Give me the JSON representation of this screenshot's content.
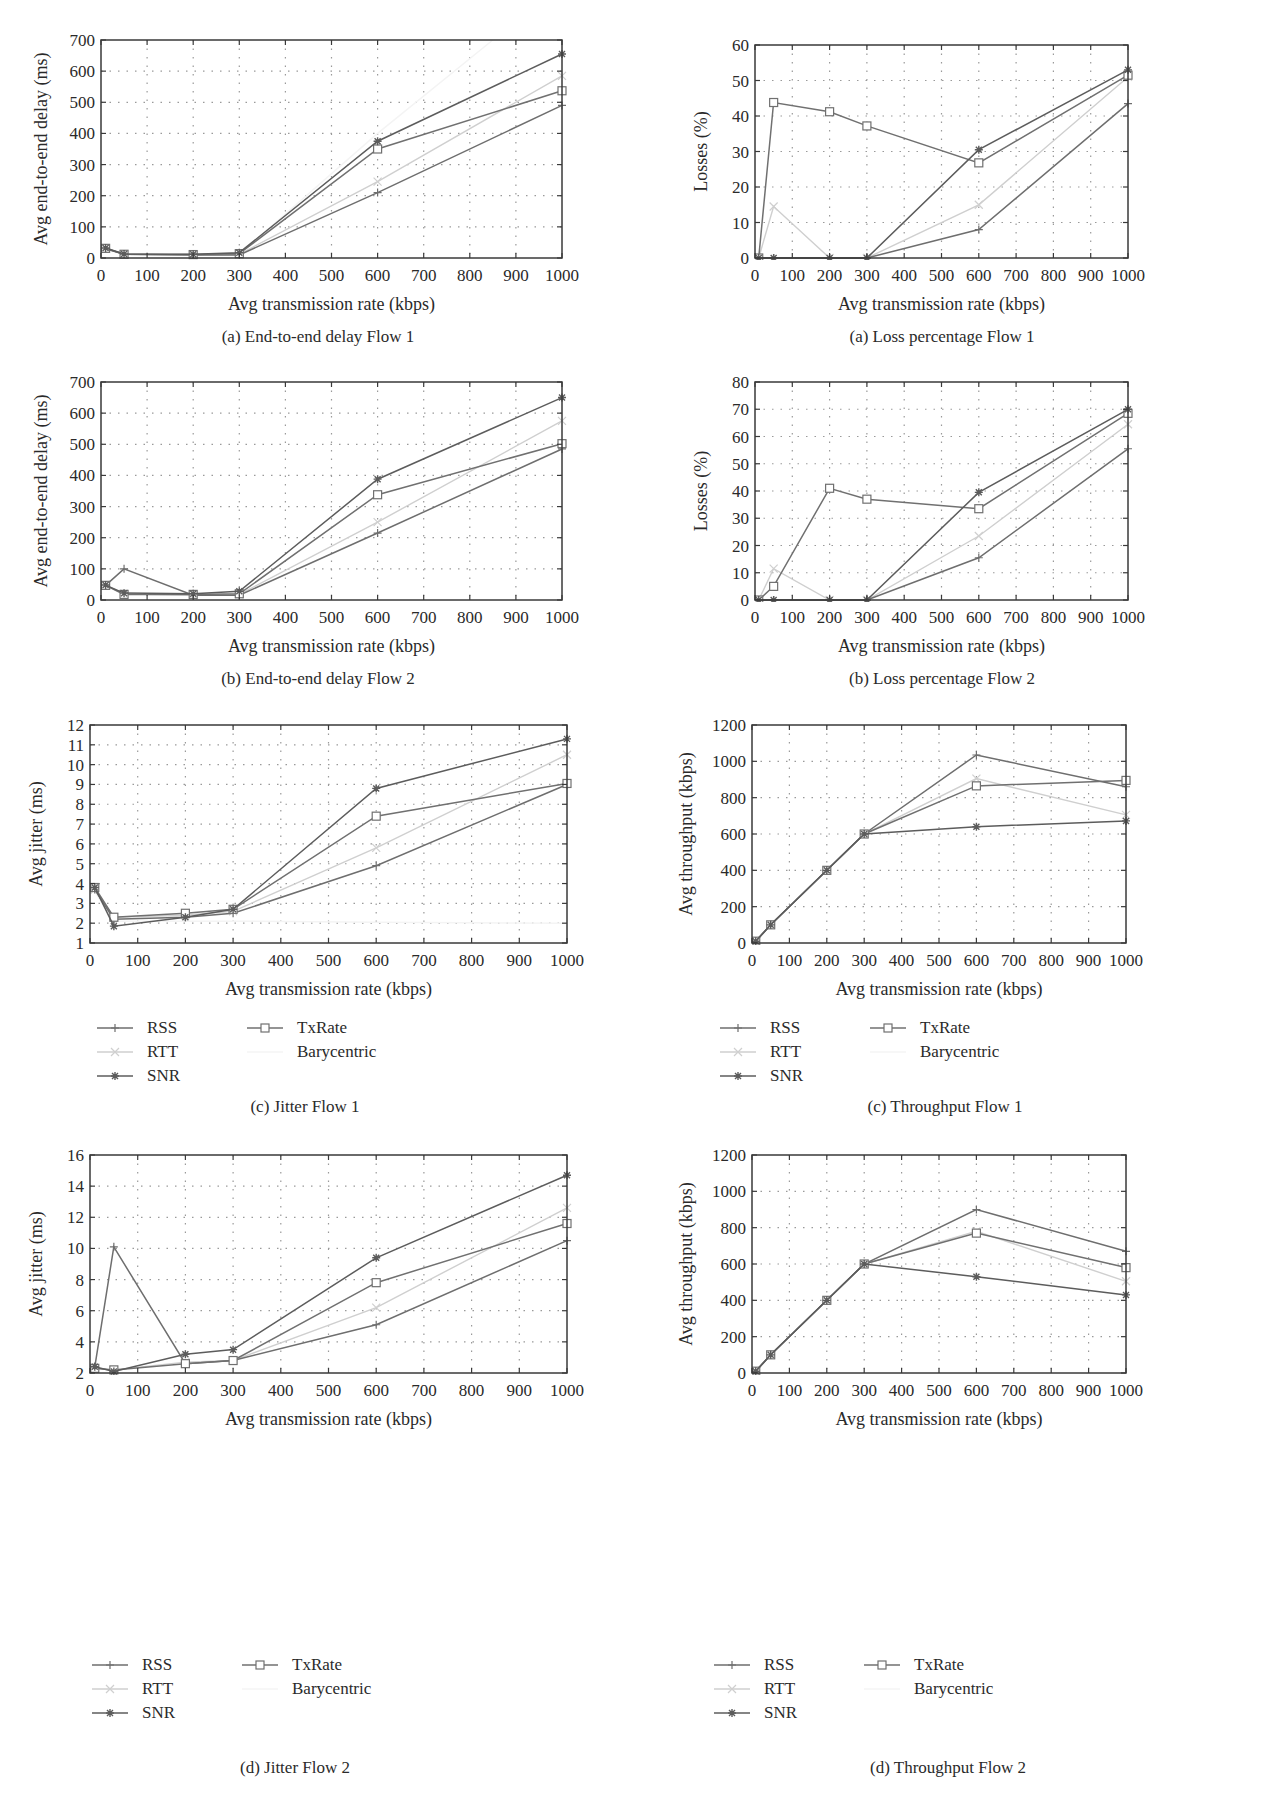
{
  "figure": {
    "series_styles": {
      "RSS": {
        "color": "#6e6e6e",
        "marker": "plus"
      },
      "RTT": {
        "color": "#cfcfcf",
        "marker": "x"
      },
      "SNR": {
        "color": "#5c5c5c",
        "marker": "star"
      },
      "TxRate": {
        "color": "#707070",
        "marker": "square"
      },
      "Barycentric": {
        "color": "#f4f4f4",
        "marker": "none"
      }
    },
    "legend_entries": [
      "RSS",
      "RTT",
      "SNR",
      "TxRate",
      "Barycentric"
    ]
  },
  "chart_data": [
    {
      "id": "delay_flow1",
      "type": "line",
      "caption": "(a)  End-to-end delay Flow 1",
      "xlabel": "Avg transmission rate (kbps)",
      "ylabel": "Avg end-to-end delay (ms)",
      "xlim": [
        0,
        1000
      ],
      "ylim": [
        0,
        700
      ],
      "xticks": [
        0,
        100,
        200,
        300,
        400,
        500,
        600,
        700,
        800,
        900,
        1000
      ],
      "yticks": [
        0,
        100,
        200,
        300,
        400,
        500,
        600,
        700
      ],
      "grid": true,
      "legend": false,
      "x": [
        10,
        50,
        200,
        300,
        600,
        1000
      ],
      "series": [
        {
          "name": "RSS",
          "values": [
            30,
            12,
            10,
            10,
            210,
            490
          ]
        },
        {
          "name": "RTT",
          "values": [
            30,
            12,
            10,
            12,
            245,
            585
          ]
        },
        {
          "name": "SNR",
          "values": [
            32,
            13,
            12,
            17,
            375,
            655
          ]
        },
        {
          "name": "TxRate",
          "values": [
            31,
            12,
            11,
            14,
            350,
            537
          ]
        },
        {
          "name": "Barycentric",
          "x": [
            10,
            50,
            200,
            300,
            600,
            850
          ],
          "values": [
            30,
            12,
            10,
            12,
            400,
            700
          ]
        }
      ]
    },
    {
      "id": "loss_flow1",
      "type": "line",
      "caption": "(a)  Loss percentage Flow 1",
      "xlabel": "Avg transmission rate (kbps)",
      "ylabel": "Losses (%)",
      "xlim": [
        0,
        1000
      ],
      "ylim": [
        0,
        60
      ],
      "xticks": [
        0,
        100,
        200,
        300,
        400,
        500,
        600,
        700,
        800,
        900,
        1000
      ],
      "yticks": [
        0,
        10,
        20,
        30,
        40,
        50,
        60
      ],
      "grid": true,
      "legend": false,
      "x": [
        10,
        50,
        200,
        300,
        600,
        1000
      ],
      "series": [
        {
          "name": "RSS",
          "values": [
            0,
            0,
            0,
            0,
            8,
            43.5
          ]
        },
        {
          "name": "RTT",
          "values": [
            0,
            14.5,
            0,
            0,
            15,
            51
          ]
        },
        {
          "name": "SNR",
          "values": [
            0,
            0,
            0,
            0,
            30.5,
            53
          ]
        },
        {
          "name": "TxRate",
          "values": [
            0,
            43.8,
            41.2,
            37.2,
            26.8,
            51.5
          ]
        }
      ]
    },
    {
      "id": "delay_flow2",
      "type": "line",
      "caption": "(b)  End-to-end delay Flow 2",
      "xlabel": "Avg transmission rate (kbps)",
      "ylabel": "Avg end-to-end delay (ms)",
      "xlim": [
        0,
        1000
      ],
      "ylim": [
        0,
        700
      ],
      "xticks": [
        0,
        100,
        200,
        300,
        400,
        500,
        600,
        700,
        800,
        900,
        1000
      ],
      "yticks": [
        0,
        100,
        200,
        300,
        400,
        500,
        600,
        700
      ],
      "grid": true,
      "legend": false,
      "x": [
        10,
        50,
        200,
        300,
        600,
        1000
      ],
      "series": [
        {
          "name": "RSS",
          "values": [
            47,
            100,
            15,
            15,
            215,
            485
          ]
        },
        {
          "name": "RTT",
          "values": [
            47,
            20,
            15,
            18,
            250,
            575
          ]
        },
        {
          "name": "SNR",
          "values": [
            48,
            22,
            20,
            28,
            388,
            650
          ]
        },
        {
          "name": "TxRate",
          "values": [
            47,
            18,
            18,
            20,
            338,
            502
          ]
        }
      ]
    },
    {
      "id": "loss_flow2",
      "type": "line",
      "caption": "(b)  Loss percentage Flow 2",
      "xlabel": "Avg transmission rate (kbps)",
      "ylabel": "Losses (%)",
      "xlim": [
        0,
        1000
      ],
      "ylim": [
        0,
        80
      ],
      "xticks": [
        0,
        100,
        200,
        300,
        400,
        500,
        600,
        700,
        800,
        900,
        1000
      ],
      "yticks": [
        0,
        10,
        20,
        30,
        40,
        50,
        60,
        70,
        80
      ],
      "grid": true,
      "legend": false,
      "x": [
        10,
        50,
        200,
        300,
        600,
        1000
      ],
      "series": [
        {
          "name": "RSS",
          "values": [
            0,
            0,
            0,
            0,
            15.5,
            55.5
          ]
        },
        {
          "name": "RTT",
          "values": [
            0,
            11.5,
            0,
            0,
            23.5,
            64.5
          ]
        },
        {
          "name": "SNR",
          "values": [
            0,
            0,
            0,
            0,
            39.5,
            70
          ]
        },
        {
          "name": "TxRate",
          "values": [
            0,
            5,
            41,
            37,
            33.5,
            68.5
          ]
        }
      ]
    },
    {
      "id": "jitter_flow1",
      "type": "line",
      "caption": "(c)  Jitter Flow 1",
      "xlabel": "Avg transmission rate (kbps)",
      "ylabel": "Avg jitter (ms)",
      "xlim": [
        0,
        1000
      ],
      "ylim": [
        1,
        12
      ],
      "xticks": [
        0,
        100,
        200,
        300,
        400,
        500,
        600,
        700,
        800,
        900,
        1000
      ],
      "yticks": [
        1,
        2,
        3,
        4,
        5,
        6,
        7,
        8,
        9,
        10,
        11,
        12
      ],
      "grid": true,
      "legend": true,
      "x": [
        10,
        50,
        200,
        300,
        600,
        1000
      ],
      "series": [
        {
          "name": "RSS",
          "values": [
            3.7,
            2.2,
            2.3,
            2.5,
            4.9,
            9.0
          ]
        },
        {
          "name": "RTT",
          "values": [
            3.7,
            2.3,
            2.4,
            2.6,
            5.8,
            10.5
          ]
        },
        {
          "name": "SNR",
          "values": [
            3.8,
            1.85,
            2.3,
            2.7,
            8.8,
            11.3
          ]
        },
        {
          "name": "TxRate",
          "values": [
            3.8,
            2.3,
            2.5,
            2.7,
            7.4,
            9.05
          ]
        },
        {
          "name": "Barycentric",
          "values": [
            3.6,
            2.1,
            2.1,
            2.1,
            2.05,
            2.0
          ]
        }
      ]
    },
    {
      "id": "throughput_flow1",
      "type": "line",
      "caption": "(c)  Throughput Flow 1",
      "xlabel": "Avg transmission rate (kbps)",
      "ylabel": "Avg throughput (kbps)",
      "xlim": [
        0,
        1000
      ],
      "ylim": [
        0,
        1200
      ],
      "xticks": [
        0,
        100,
        200,
        300,
        400,
        500,
        600,
        700,
        800,
        900,
        1000
      ],
      "yticks": [
        0,
        200,
        400,
        600,
        800,
        1000,
        1200
      ],
      "grid": true,
      "legend": true,
      "x": [
        10,
        50,
        200,
        300,
        600,
        1000
      ],
      "series": [
        {
          "name": "RSS",
          "values": [
            10,
            100,
            400,
            600,
            1035,
            860
          ]
        },
        {
          "name": "RTT",
          "values": [
            10,
            100,
            400,
            600,
            905,
            705
          ]
        },
        {
          "name": "SNR",
          "values": [
            10,
            100,
            400,
            600,
            640,
            672
          ]
        },
        {
          "name": "TxRate",
          "values": [
            10,
            100,
            400,
            600,
            865,
            895
          ]
        }
      ]
    },
    {
      "id": "jitter_flow2",
      "type": "line",
      "caption": "(d)  Jitter Flow 2",
      "xlabel": "Avg transmission rate (kbps)",
      "ylabel": "Avg jitter (ms)",
      "xlim": [
        0,
        1000
      ],
      "ylim": [
        2,
        16
      ],
      "xticks": [
        0,
        100,
        200,
        300,
        400,
        500,
        600,
        700,
        800,
        900,
        1000
      ],
      "yticks": [
        2,
        4,
        6,
        8,
        10,
        12,
        14,
        16
      ],
      "grid": true,
      "legend": true,
      "x": [
        10,
        50,
        200,
        300,
        600,
        1000
      ],
      "series": [
        {
          "name": "RSS",
          "values": [
            2.4,
            10.1,
            2.6,
            2.8,
            5.1,
            10.5
          ]
        },
        {
          "name": "RTT",
          "values": [
            2.3,
            2.2,
            2.7,
            2.8,
            6.2,
            12.6
          ]
        },
        {
          "name": "SNR",
          "values": [
            2.4,
            2.1,
            3.2,
            3.5,
            9.4,
            14.7
          ]
        },
        {
          "name": "TxRate",
          "values": [
            2.3,
            2.2,
            2.6,
            2.8,
            7.8,
            11.6
          ]
        }
      ]
    },
    {
      "id": "throughput_flow2",
      "type": "line",
      "caption": "(d)  Throughput Flow 2",
      "xlabel": "Avg transmission rate (kbps)",
      "ylabel": "Avg throughput (kbps)",
      "xlim": [
        0,
        1000
      ],
      "ylim": [
        0,
        1200
      ],
      "xticks": [
        0,
        100,
        200,
        300,
        400,
        500,
        600,
        700,
        800,
        900,
        1000
      ],
      "yticks": [
        0,
        200,
        400,
        600,
        800,
        1000,
        1200
      ],
      "grid": true,
      "legend": true,
      "x": [
        10,
        50,
        200,
        300,
        600,
        1000
      ],
      "series": [
        {
          "name": "RSS",
          "values": [
            10,
            100,
            400,
            600,
            900,
            670
          ]
        },
        {
          "name": "RTT",
          "values": [
            10,
            100,
            400,
            600,
            780,
            505
          ]
        },
        {
          "name": "SNR",
          "values": [
            10,
            100,
            400,
            600,
            530,
            430
          ]
        },
        {
          "name": "TxRate",
          "values": [
            10,
            100,
            400,
            600,
            770,
            580
          ]
        }
      ]
    }
  ]
}
